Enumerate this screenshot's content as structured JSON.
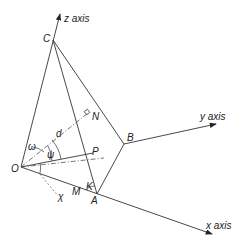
{
  "diagram": {
    "axes": {
      "z": {
        "label": "z axis"
      },
      "y": {
        "label": "y axis"
      },
      "x": {
        "label": "x axis"
      }
    },
    "points": {
      "O": "O",
      "C": "C",
      "A": "A",
      "B": "B",
      "P": "P",
      "N": "N",
      "M": "M",
      "K": "K"
    },
    "symbols": {
      "omega": "ω",
      "psi": "ψ",
      "d": "d",
      "chi": "χ"
    },
    "colors": {
      "line": "#333333",
      "background": "#ffffff"
    }
  }
}
